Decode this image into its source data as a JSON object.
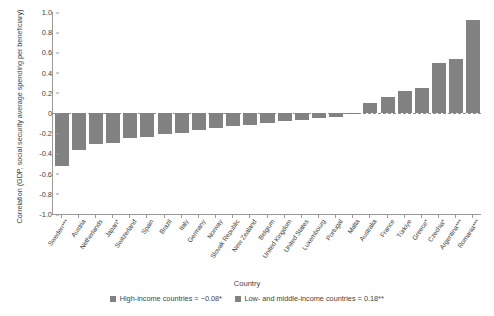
{
  "chart_data": {
    "type": "bar",
    "title": "",
    "xlabel": "Country",
    "ylabel": "Correlation (GDP, social security average spending per beneficiary)",
    "ylim": [
      -1.0,
      1.0
    ],
    "ytick_labels": [
      "1.0",
      "0.8",
      "0.6",
      "0.4",
      "0.2",
      "0",
      "-0.2",
      "-0.4",
      "-0.6",
      "-0.8",
      "-1.0"
    ],
    "ytick_values": [
      1.0,
      0.8,
      0.6,
      0.4,
      0.2,
      0,
      -0.2,
      -0.4,
      -0.6,
      -0.8,
      -1.0
    ],
    "grid": false,
    "legend_position": "bottom",
    "bar_color": "#828282",
    "categories": [
      "Sweden***",
      "Austria",
      "Netherlands",
      "Japan*",
      "Switzerland",
      "Spain",
      "Brazil",
      "Italy",
      "Germany",
      "Norway",
      "Slovak Republic",
      "New Zealand",
      "Belgium",
      "United Kingdom",
      "United States",
      "Luxembourg",
      "Portugal",
      "Malta",
      "Australia",
      "France",
      "Türkiye",
      "Greece*",
      "Czechia*",
      "Argentina***",
      "Romania***"
    ],
    "values": [
      -0.52,
      -0.37,
      -0.31,
      -0.3,
      -0.25,
      -0.24,
      -0.21,
      -0.2,
      -0.17,
      -0.15,
      -0.13,
      -0.12,
      -0.1,
      -0.08,
      -0.07,
      -0.05,
      -0.04,
      -0.01,
      0.1,
      0.16,
      0.22,
      0.25,
      0.5,
      0.53,
      0.92
    ],
    "legend": [
      {
        "label": "High-income countries = −0.08*",
        "color": "#828282"
      },
      {
        "label": "Low- and middle-income countries = 0.18**",
        "color": "#828282"
      }
    ]
  }
}
